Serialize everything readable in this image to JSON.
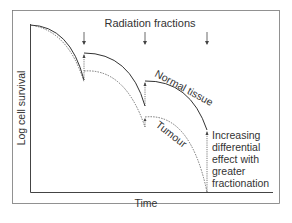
{
  "diagram": {
    "title": "Radiation fractions",
    "xlabel": "Time",
    "ylabel": "Log cell survival",
    "curve_labels": {
      "normal": "Normal tissue",
      "tumour": "Tumour"
    },
    "annotation_lines": [
      "Increasing",
      "differential",
      "effect with",
      "greater",
      "fractionation"
    ],
    "fraction_count": 3,
    "colors": {
      "line": "#333333",
      "frame": "#555555"
    }
  }
}
